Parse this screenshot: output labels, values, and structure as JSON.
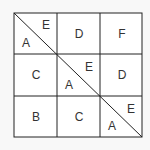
{
  "diagram": {
    "type": "3x3 grid with main diagonal",
    "cells": [
      {
        "row": 0,
        "col": 0,
        "split": true,
        "upper": "E",
        "lower": "A"
      },
      {
        "row": 0,
        "col": 1,
        "label": "D"
      },
      {
        "row": 0,
        "col": 2,
        "label": "F"
      },
      {
        "row": 1,
        "col": 0,
        "label": "C"
      },
      {
        "row": 1,
        "col": 1,
        "split": true,
        "upper": "E",
        "lower": "A"
      },
      {
        "row": 1,
        "col": 2,
        "label": "D"
      },
      {
        "row": 2,
        "col": 0,
        "label": "B"
      },
      {
        "row": 2,
        "col": 1,
        "label": "C"
      },
      {
        "row": 2,
        "col": 2,
        "split": true,
        "upper": "E",
        "lower": "A"
      }
    ],
    "labels": {
      "r0c0_upper": "E",
      "r0c0_lower": "A",
      "r0c1": "D",
      "r0c2": "F",
      "r1c0": "C",
      "r1c1_upper": "E",
      "r1c1_lower": "A",
      "r1c2": "D",
      "r2c0": "B",
      "r2c1": "C",
      "r2c2_upper": "E",
      "r2c2_lower": "A"
    },
    "colors": {
      "line": "#222222",
      "background": "#ffffff",
      "page": "#f8f8f8"
    }
  }
}
